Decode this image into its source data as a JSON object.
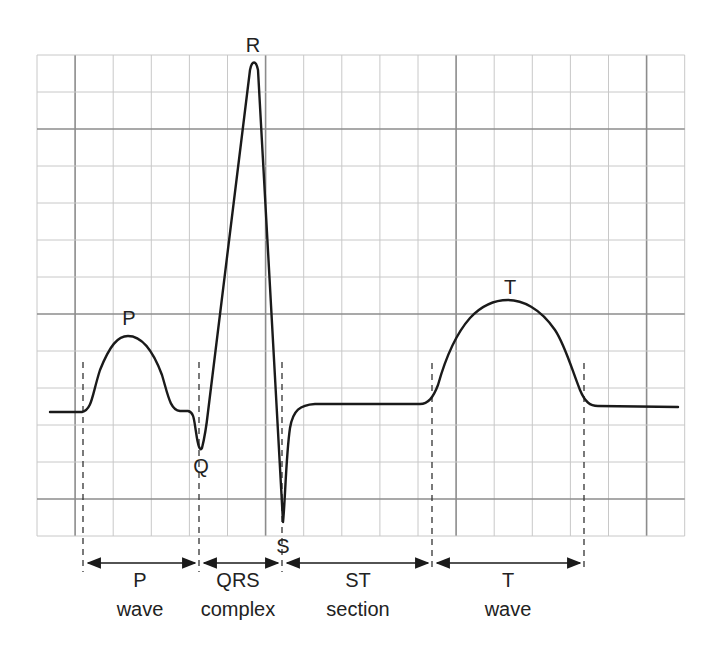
{
  "diagram": {
    "colors": {
      "background": "#ffffff",
      "grid_minor": "#c8c8c8",
      "grid_major": "#8c8c8c",
      "trace": "#1a1a1a",
      "text": "#222222"
    },
    "grid": {
      "x0": 37,
      "y0": 55,
      "cols": 17,
      "rows": 13,
      "cell_w": 38.1,
      "cell_h": 37,
      "major_every": 5,
      "major_offset": 1
    },
    "wave_labels": {
      "p": "P",
      "q": "Q",
      "r": "R",
      "s": "S",
      "t": "T"
    },
    "segments": [
      {
        "line1": "P",
        "line2": "wave"
      },
      {
        "line1": "QRS",
        "line2": "complex"
      },
      {
        "line1": "ST",
        "line2": "section"
      },
      {
        "line1": "T",
        "line2": "wave"
      }
    ]
  }
}
